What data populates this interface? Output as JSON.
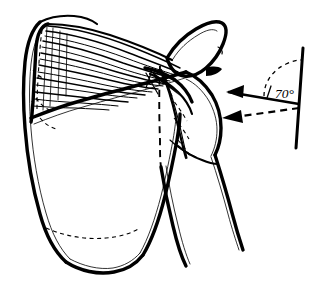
{
  "figure": {
    "background_color": "#ffffff",
    "ink_color": "#000000",
    "width": 329,
    "height": 296
  },
  "annotations": {
    "angle_label": "70°",
    "angle_value": 70,
    "angle_unit": "degrees",
    "tick_glyph": "/",
    "reference_line_name": "vertical-reference-line",
    "arrows": [
      {
        "id": "solid-arrow",
        "style": "solid",
        "direction": "left",
        "target": "greater-tuberosity"
      },
      {
        "id": "dashed-arrow",
        "style": "dashed",
        "direction": "left",
        "target": "humeral-head-articular-surface"
      }
    ]
  },
  "structures": [
    {
      "id": "scapula-body",
      "label": "scapula body"
    },
    {
      "id": "scapula-spine",
      "label": "scapula spine"
    },
    {
      "id": "supraspinatus-fibers",
      "label": "supraspinatus muscle striations"
    },
    {
      "id": "acromion",
      "label": "acromion"
    },
    {
      "id": "clavicle",
      "label": "clavicle"
    },
    {
      "id": "glenoid-fossa",
      "label": "glenoid fossa"
    },
    {
      "id": "humeral-head",
      "label": "humeral head"
    },
    {
      "id": "greater-tuberosity",
      "label": "greater tuberosity"
    },
    {
      "id": "humeral-shaft",
      "label": "humeral shaft"
    },
    {
      "id": "inferior-angle",
      "label": "inferior angle of scapula"
    },
    {
      "id": "humeral-axis-dashed",
      "label": "humeral anatomical axis (dashed)"
    }
  ]
}
